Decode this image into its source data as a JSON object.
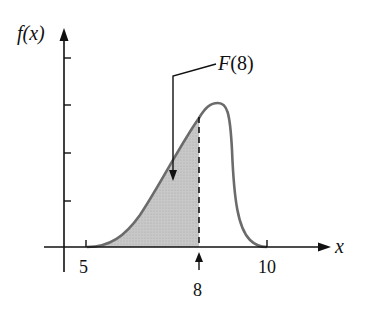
{
  "chart_data": {
    "type": "area",
    "title": "",
    "xlabel": "x",
    "ylabel": "f(x)",
    "x_ticks": [
      5,
      10
    ],
    "x_marker": 8,
    "y_tick_count": 4,
    "annotation": "F(8)",
    "shaded_region": {
      "from": 5,
      "to": 8
    },
    "curve_description": "Skewed density starting at x=5, rising to a peak near x≈8.4, falling to zero near x=10",
    "curve_points": [
      {
        "x": 5.0,
        "y": 0.0
      },
      {
        "x": 6.0,
        "y": 0.2
      },
      {
        "x": 7.0,
        "y": 0.5
      },
      {
        "x": 8.0,
        "y": 0.8
      },
      {
        "x": 8.4,
        "y": 0.86
      },
      {
        "x": 9.0,
        "y": 0.7
      },
      {
        "x": 9.3,
        "y": 0.2
      },
      {
        "x": 10.0,
        "y": 0.0
      }
    ],
    "grid": false
  },
  "labels": {
    "y_axis": "f(x)",
    "x_axis": "x",
    "tick_5": "5",
    "tick_10": "10",
    "marker_8": "8",
    "annotation": "F(8)"
  },
  "colors": {
    "axis": "#111111",
    "curve": "#6b6b6b",
    "shade": "#c4c4c4"
  }
}
